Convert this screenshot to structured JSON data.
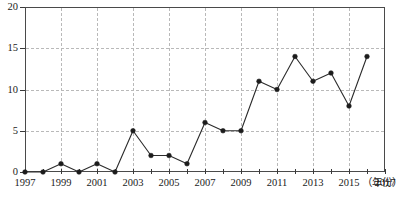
{
  "chart_data": {
    "type": "line",
    "title": "",
    "xlabel": "（年份）",
    "ylabel": "",
    "x": [
      1997,
      1998,
      1999,
      2000,
      2001,
      2002,
      2003,
      2004,
      2005,
      2006,
      2007,
      2008,
      2009,
      2010,
      2011,
      2012,
      2013,
      2014,
      2015,
      2016
    ],
    "values": [
      0,
      0,
      1,
      0,
      1,
      0,
      5,
      2,
      2,
      1,
      6,
      5,
      5,
      11,
      10,
      14,
      11,
      12,
      8,
      14
    ],
    "series": [
      {
        "name": "",
        "values": [
          0,
          0,
          1,
          0,
          1,
          0,
          5,
          2,
          2,
          1,
          6,
          5,
          5,
          11,
          10,
          14,
          11,
          12,
          8,
          14
        ]
      }
    ],
    "xlim": [
      1997,
      2017
    ],
    "ylim": [
      0,
      20
    ],
    "ytick_labels": [
      "0",
      "5",
      "10",
      "15",
      "20"
    ],
    "ytick_values": [
      0,
      5,
      10,
      15,
      20
    ],
    "xtick_labels": [
      "1997",
      "1999",
      "2001",
      "2003",
      "2005",
      "2007",
      "2009",
      "2011",
      "2013",
      "2015",
      "2017"
    ],
    "xtick_values": [
      1997,
      1999,
      2001,
      2003,
      2005,
      2007,
      2009,
      2011,
      2013,
      2015,
      2017
    ],
    "xminor_values": [
      1998,
      2000,
      2002,
      2004,
      2006,
      2008,
      2010,
      2012,
      2014,
      2016
    ],
    "grid": true,
    "grid_style": "dashed",
    "grid_color": "#b9b9b9",
    "legend": false,
    "marker": "circle",
    "line_color": "#2b2b2b",
    "marker_color": "#1c1c1c",
    "axis_color": "#4a4a4a",
    "background": "#ffffff"
  }
}
